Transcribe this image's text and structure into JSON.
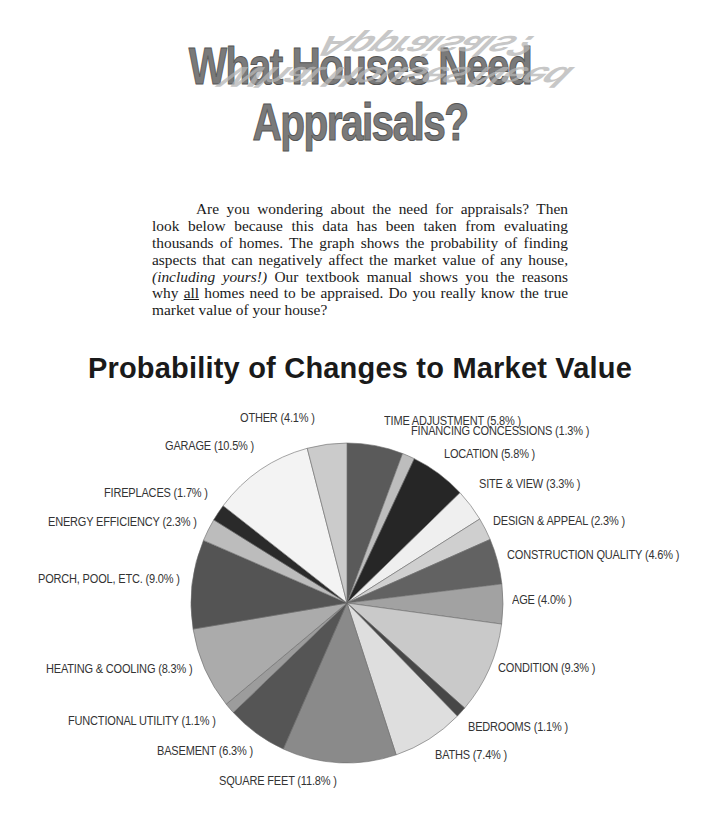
{
  "header": {
    "title": "What Houses Need Appraisals?"
  },
  "intro": {
    "part1": "Are you wondering about the need for appraisals?  Then look below because this data has been taken from evaluating thousands of homes.  The graph shows the probability of finding aspects that can negatively affect the market value of any house, ",
    "emphasis": "(including yours!)",
    "part2": "  Our textbook manual shows you the reasons why ",
    "underlined": "all",
    "part3": " homes need to be appraised.  Do you really know the true market value of your house?"
  },
  "chart_data": {
    "type": "pie",
    "title": "Probability of Changes to Market Value",
    "start_angle": "12 o'clock",
    "direction": "clockwise",
    "unit": "%",
    "categories": [
      "TIME ADJUSTMENT",
      "FINANCING CONCESSIONS",
      "LOCATION",
      "SITE & VIEW",
      "DESIGN & APPEAL",
      "CONSTRUCTION QUALITY",
      "AGE",
      "CONDITION",
      "BEDROOMS",
      "BATHS",
      "SQUARE FEET",
      "BASEMENT",
      "FUNCTIONAL UTILITY",
      "HEATING & COOLING",
      "PORCH, POOL, ETC.",
      "ENERGY EFFICIENCY",
      "FIREPLACES",
      "GARAGE",
      "OTHER"
    ],
    "values": [
      5.8,
      1.3,
      5.8,
      3.3,
      2.3,
      4.6,
      4.0,
      9.3,
      1.1,
      7.4,
      11.8,
      6.3,
      1.1,
      8.3,
      9.0,
      2.3,
      1.7,
      10.5,
      4.1
    ],
    "colors": [
      "#5a5a5a",
      "#bdbdbd",
      "#262626",
      "#efefef",
      "#cfcfcf",
      "#626262",
      "#a2a2a2",
      "#c9c9c9",
      "#474747",
      "#dedede",
      "#8a8a8a",
      "#555555",
      "#9c9c9c",
      "#ababab",
      "#545454",
      "#bcbcbc",
      "#2a2a2a",
      "#f3f3f3",
      "#cbcbcb"
    ],
    "labels": [
      "TIME ADJUSTMENT (5.8% )",
      "FINANCING CONCESSIONS (1.3% )",
      "LOCATION (5.8% )",
      "SITE & VIEW (3.3% )",
      "DESIGN & APPEAL (2.3% )",
      "CONSTRUCTION QUALITY (4.6% )",
      "AGE (4.0% )",
      "CONDITION (9.3% )",
      "BEDROOMS (1.1% )",
      "BATHS (7.4% )",
      "SQUARE FEET (11.8% )",
      "BASEMENT (6.3% )",
      "FUNCTIONAL UTILITY (1.1% )",
      "HEATING & COOLING (8.3% )",
      "PORCH, POOL, ETC. (9.0% )",
      "ENERGY EFFICIENCY (2.3% )",
      "FIREPLACES (1.7% )",
      "GARAGE (10.5% )",
      "OTHER (4.1% )"
    ],
    "legend": "none (labels placed around pie)"
  }
}
